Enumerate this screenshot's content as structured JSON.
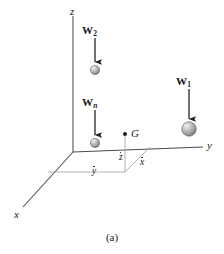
{
  "figure": {
    "caption": "(a)",
    "background_color": "#ffffff",
    "ink_color": "#2a2a2a",
    "dashed_color": "#9a9a9a",
    "sphere_color": "#b0b0b0",
    "sphere_highlight": "#e8e8e8",
    "sphere_shadow": "#6e6e6e"
  },
  "axes": [
    {
      "id": "z",
      "label": "z",
      "label_x": 70,
      "label_y": 6,
      "orientation": "vertical"
    },
    {
      "id": "y",
      "label": "y",
      "label_x": 207,
      "label_y": 140,
      "orientation": "horizontal-right"
    },
    {
      "id": "x",
      "label": "x",
      "label_x": 14,
      "label_y": 209,
      "orientation": "diagonal-lower-left"
    }
  ],
  "forces": [
    {
      "id": "w2",
      "symbol": "W",
      "subscript": "2",
      "subscript_italic": false,
      "label_x": 82,
      "label_y": 25,
      "arrow_x": 95,
      "arrow_top_y": 38,
      "arrow_bottom_y": 62,
      "sphere_cx": 95,
      "sphere_cy": 70,
      "sphere_r": 4.6
    },
    {
      "id": "wn",
      "symbol": "W",
      "subscript": "n",
      "subscript_italic": true,
      "label_x": 82,
      "label_y": 97,
      "arrow_x": 95,
      "arrow_top_y": 110,
      "arrow_bottom_y": 135,
      "sphere_cx": 95,
      "sphere_cy": 143,
      "sphere_r": 4.6
    },
    {
      "id": "w1",
      "symbol": "W",
      "subscript": "1",
      "subscript_italic": false,
      "label_x": 176,
      "label_y": 76,
      "arrow_x": 189,
      "arrow_top_y": 89,
      "arrow_bottom_y": 119,
      "sphere_cx": 189,
      "sphere_cy": 129,
      "sphere_r": 7.2
    }
  ],
  "centroid": {
    "id": "G",
    "label": "G",
    "label_x": 131,
    "label_y": 128,
    "dot_x": 125,
    "dot_y": 134,
    "dot_r": 2.0
  },
  "coordinate_labels": [
    {
      "id": "zbar",
      "label": "z",
      "x": 119,
      "y": 147
    },
    {
      "id": "xbar",
      "label": "x",
      "x": 140,
      "y": 152
    },
    {
      "id": "ybar",
      "label": "y",
      "x": 92,
      "y": 161
    }
  ],
  "geometry": {
    "origin": {
      "x": 73,
      "y": 152
    },
    "z_axis_top": {
      "x": 73,
      "y": 16
    },
    "y_axis_end": {
      "x": 203,
      "y": 147
    },
    "x_axis_end": {
      "x": 23,
      "y": 207
    },
    "foot_point": {
      "x": 125,
      "y": 152
    },
    "projection_corner": {
      "x": 98,
      "y": 172
    },
    "dashed_right_end": {
      "x": 150,
      "y": 147
    }
  }
}
